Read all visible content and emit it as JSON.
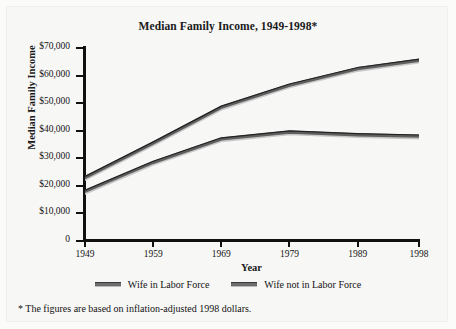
{
  "chart_data": {
    "type": "line",
    "title": "Median Family Income, 1949-1998*",
    "xlabel": "Year",
    "ylabel": "Median Family Income",
    "x": [
      1949,
      1959,
      1969,
      1979,
      1989,
      1998
    ],
    "xtick_labels": [
      "1949",
      "1959",
      "1969",
      "1979",
      "1989",
      "1998"
    ],
    "ytick_labels": [
      "$70,000",
      "$60,000",
      "$50,000",
      "$40,000",
      "$30,000",
      "$20,000",
      "$10,000",
      "0"
    ],
    "ytick_values": [
      70000,
      60000,
      50000,
      40000,
      30000,
      20000,
      10000,
      0
    ],
    "ylim": [
      0,
      70000
    ],
    "xlim": [
      1949,
      1998
    ],
    "grid": false,
    "legend_position": "bottom",
    "series": [
      {
        "name": "Wife in Labor Force",
        "color": "#5f5f5f",
        "values": [
          23000,
          35500,
          48500,
          56500,
          62500,
          65500
        ]
      },
      {
        "name": "Wife not in Labor Force",
        "color": "#5f5f5f",
        "values": [
          18000,
          28500,
          37000,
          39500,
          38500,
          38000
        ]
      }
    ],
    "footnote": "* The figures are based on inflation-adjusted 1998 dollars."
  },
  "legend": {
    "items": [
      {
        "label": "Wife in Labor Force"
      },
      {
        "label": "Wife not in Labor Force"
      }
    ]
  }
}
